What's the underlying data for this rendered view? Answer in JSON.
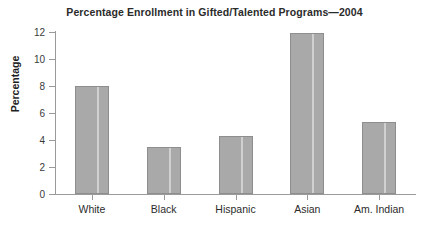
{
  "chart_data": {
    "type": "bar",
    "title": "Percentage Enrollment in Gifted/Talented Programs—2004",
    "xlabel": "",
    "ylabel": "Percentage",
    "categories": [
      "White",
      "Black",
      "Hispanic",
      "Asian",
      "Am. Indian"
    ],
    "values": [
      8.0,
      3.5,
      4.3,
      11.9,
      5.3
    ],
    "ylim": [
      0,
      12
    ],
    "yticks": [
      0,
      2,
      4,
      6,
      8,
      10,
      12
    ],
    "ytick_labels": [
      "0",
      "2",
      "4",
      "6",
      "8",
      "10",
      "12"
    ],
    "grid": false,
    "legend": null,
    "bar_color": "#a9a9a9",
    "bar_edge_color": "#8e8e8e",
    "axis_color": "#9a9a9a",
    "background_color": "#ffffff",
    "text_color": "#2b2b2b"
  }
}
